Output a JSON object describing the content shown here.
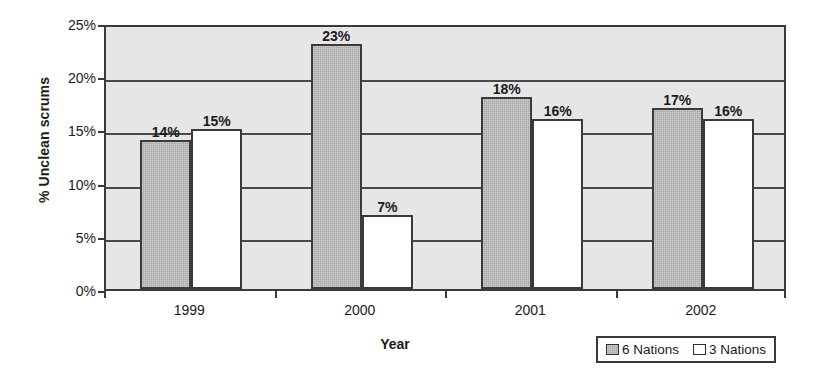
{
  "chart_data": {
    "type": "bar",
    "title": "",
    "xlabel": "Year",
    "ylabel": "% Unclean scrums",
    "categories": [
      "1999",
      "2000",
      "2001",
      "2002"
    ],
    "series": [
      {
        "name": "6 Nations",
        "values": [
          14,
          23,
          18,
          17
        ],
        "color": "#a8a8a8"
      },
      {
        "name": "3 Nations",
        "values": [
          15,
          7,
          16,
          16
        ],
        "color": "#ffffff"
      }
    ],
    "value_labels": [
      [
        "14%",
        "15%"
      ],
      [
        "23%",
        "7%"
      ],
      [
        "18%",
        "16%"
      ],
      [
        "17%",
        "16%"
      ]
    ],
    "ylim": [
      0,
      25
    ],
    "ytick_values": [
      0,
      5,
      10,
      15,
      20,
      25
    ],
    "ytick_labels": [
      "0%",
      "5%",
      "10%",
      "15%",
      "20%",
      "25%"
    ],
    "grid": true,
    "legend_position": "bottom-right",
    "plot_background": "#e6e6e6",
    "axis_color": "#3a3a3a"
  },
  "legend": {
    "entries": [
      {
        "label": "6 Nations"
      },
      {
        "label": "3 Nations"
      }
    ]
  }
}
